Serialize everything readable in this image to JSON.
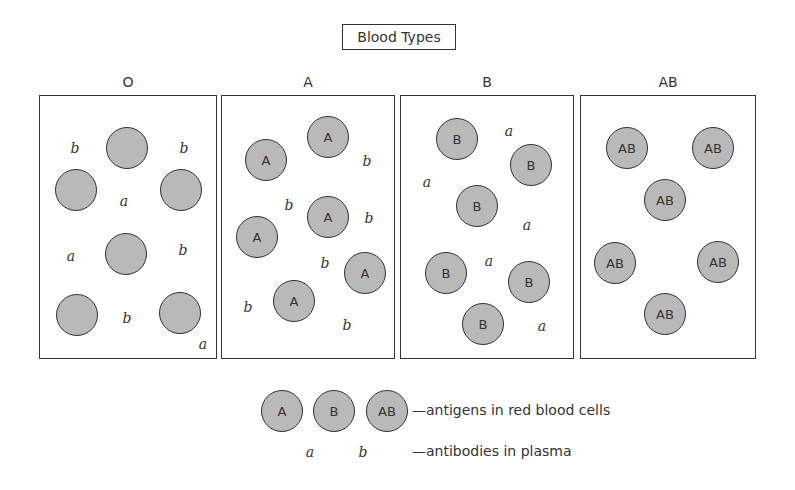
{
  "title": "Blood Types",
  "colors": {
    "cell_fill": "#b9b9b9",
    "stroke": "#333333",
    "background": "#ffffff"
  },
  "panels": [
    {
      "label": "O",
      "left": 39,
      "width": 178,
      "cells": [
        {
          "x": 127,
          "y": 148,
          "text": ""
        },
        {
          "x": 76,
          "y": 190,
          "text": ""
        },
        {
          "x": 181,
          "y": 190,
          "text": ""
        },
        {
          "x": 126,
          "y": 254,
          "text": ""
        },
        {
          "x": 77,
          "y": 315,
          "text": ""
        },
        {
          "x": 180,
          "y": 313,
          "text": ""
        }
      ],
      "antibodies": [
        {
          "x": 75,
          "y": 148,
          "text": "b"
        },
        {
          "x": 184,
          "y": 148,
          "text": "b"
        },
        {
          "x": 124,
          "y": 201,
          "text": "a"
        },
        {
          "x": 71,
          "y": 256,
          "text": "a"
        },
        {
          "x": 183,
          "y": 250,
          "text": "b"
        },
        {
          "x": 127,
          "y": 318,
          "text": "b"
        },
        {
          "x": 203,
          "y": 344,
          "text": "a"
        }
      ]
    },
    {
      "label": "A",
      "left": 221,
      "width": 174,
      "cells": [
        {
          "x": 266,
          "y": 160,
          "text": "A"
        },
        {
          "x": 328,
          "y": 137,
          "text": "A"
        },
        {
          "x": 328,
          "y": 217,
          "text": "A"
        },
        {
          "x": 257,
          "y": 237,
          "text": "A"
        },
        {
          "x": 365,
          "y": 273,
          "text": "A"
        },
        {
          "x": 294,
          "y": 301,
          "text": "A"
        }
      ],
      "antibodies": [
        {
          "x": 367,
          "y": 161,
          "text": "b"
        },
        {
          "x": 289,
          "y": 205,
          "text": "b"
        },
        {
          "x": 369,
          "y": 218,
          "text": "b"
        },
        {
          "x": 325,
          "y": 263,
          "text": "b"
        },
        {
          "x": 248,
          "y": 307,
          "text": "b"
        },
        {
          "x": 347,
          "y": 325,
          "text": "b"
        }
      ]
    },
    {
      "label": "B",
      "left": 400,
      "width": 174,
      "cells": [
        {
          "x": 457,
          "y": 139,
          "text": "B"
        },
        {
          "x": 531,
          "y": 165,
          "text": "B"
        },
        {
          "x": 477,
          "y": 206,
          "text": "B"
        },
        {
          "x": 446,
          "y": 273,
          "text": "B"
        },
        {
          "x": 529,
          "y": 282,
          "text": "B"
        },
        {
          "x": 483,
          "y": 324,
          "text": "B"
        }
      ],
      "antibodies": [
        {
          "x": 509,
          "y": 131,
          "text": "a"
        },
        {
          "x": 427,
          "y": 182,
          "text": "a"
        },
        {
          "x": 527,
          "y": 225,
          "text": "a"
        },
        {
          "x": 489,
          "y": 261,
          "text": "a"
        },
        {
          "x": 542,
          "y": 326,
          "text": "a"
        }
      ]
    },
    {
      "label": "AB",
      "left": 580,
      "width": 176,
      "cells": [
        {
          "x": 627,
          "y": 148,
          "text": "AB"
        },
        {
          "x": 713,
          "y": 148,
          "text": "AB"
        },
        {
          "x": 665,
          "y": 200,
          "text": "AB"
        },
        {
          "x": 615,
          "y": 263,
          "text": "AB"
        },
        {
          "x": 718,
          "y": 262,
          "text": "AB"
        },
        {
          "x": 665,
          "y": 314,
          "text": "AB"
        }
      ],
      "antibodies": []
    }
  ],
  "legend": {
    "cells": [
      {
        "x": 282,
        "y": 411,
        "text": "A"
      },
      {
        "x": 334,
        "y": 411,
        "text": "B"
      },
      {
        "x": 387,
        "y": 411,
        "text": "AB"
      }
    ],
    "antibodies": [
      {
        "x": 310,
        "y": 452,
        "text": "a"
      },
      {
        "x": 363,
        "y": 452,
        "text": "b"
      }
    ],
    "antigens_label": "—antigens in red blood cells",
    "antibodies_label": "—antibodies in plasma"
  }
}
